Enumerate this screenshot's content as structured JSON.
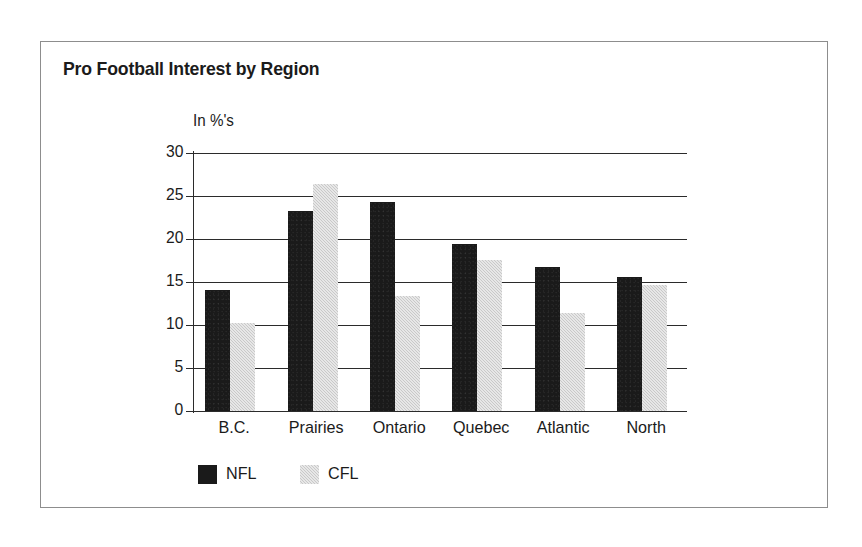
{
  "figure": {
    "title": "Pro Football Interest by Region",
    "unit_label": "In %'s"
  },
  "legend": {
    "position": "bottom-left",
    "items": [
      {
        "label": "NFL",
        "color": "#1a1a1a",
        "swatch": "nfl"
      },
      {
        "label": "CFL",
        "color": "#c9c9c9",
        "swatch": "cfl"
      }
    ]
  },
  "chart_data": {
    "type": "bar",
    "title": "Pro Football Interest by Region",
    "subtitle": "",
    "xlabel": "",
    "ylabel": "In %'s",
    "ylim": [
      0,
      30
    ],
    "yticks": [
      0,
      5,
      10,
      15,
      20,
      25,
      30
    ],
    "ytick_labels": [
      "0",
      "5",
      "10",
      "15",
      "20",
      "25",
      "30"
    ],
    "grid": true,
    "grid_axis": "y",
    "legend_position": "bottom-left",
    "categories": [
      "B.C.",
      "Prairies",
      "Ontario",
      "Quebec",
      "Atlantic",
      "North"
    ],
    "series": [
      {
        "name": "NFL",
        "color": "#1a1a1a",
        "values": [
          14.1,
          23.3,
          24.3,
          19.4,
          16.8,
          15.6
        ]
      },
      {
        "name": "CFL",
        "color": "#c9c9c9",
        "values": [
          10.2,
          26.4,
          13.4,
          17.6,
          11.4,
          14.7
        ]
      }
    ]
  }
}
